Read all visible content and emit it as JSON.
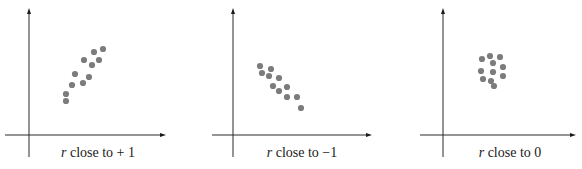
{
  "figure": {
    "panels": [
      {
        "caption_var": "r",
        "caption_text": " close to + 1",
        "caption_x": 98,
        "axes": {
          "origin_x": 29,
          "axis_y": 135,
          "y_top": 8,
          "y_bottom": 157,
          "x_left": 5,
          "x_right": 166
        },
        "points": [
          [
            66,
            101
          ],
          [
            66,
            94
          ],
          [
            72,
            85
          ],
          [
            75,
            74
          ],
          [
            83,
            83
          ],
          [
            89,
            77
          ],
          [
            84,
            60
          ],
          [
            92,
            65
          ],
          [
            94,
            52
          ],
          [
            99,
            60
          ],
          [
            103,
            49
          ]
        ]
      },
      {
        "caption_var": "r",
        "caption_text": " close to −1",
        "caption_x": 302,
        "axes": {
          "origin_x": 233,
          "axis_y": 135,
          "y_top": 8,
          "y_bottom": 157,
          "x_left": 212,
          "x_right": 372
        },
        "points": [
          [
            260,
            66
          ],
          [
            262,
            73
          ],
          [
            271,
            69
          ],
          [
            269,
            76
          ],
          [
            279,
            78
          ],
          [
            273,
            86
          ],
          [
            279,
            91
          ],
          [
            287,
            87
          ],
          [
            287,
            97
          ],
          [
            297,
            97
          ],
          [
            301,
            108
          ]
        ]
      },
      {
        "caption_var": "r",
        "caption_text": " close to 0",
        "caption_x": 510,
        "axes": {
          "origin_x": 443,
          "axis_y": 135,
          "y_top": 8,
          "y_bottom": 157,
          "x_left": 420,
          "x_right": 576
        },
        "points": [
          [
            482,
            59
          ],
          [
            490,
            56
          ],
          [
            500,
            57
          ],
          [
            493,
            63
          ],
          [
            503,
            67
          ],
          [
            481,
            71
          ],
          [
            493,
            72
          ],
          [
            503,
            76
          ],
          [
            483,
            79
          ],
          [
            491,
            81
          ],
          [
            494,
            86
          ]
        ]
      }
    ]
  },
  "chart_data": [
    {
      "type": "scatter",
      "title": "",
      "caption": "r close to + 1",
      "xlabel": "",
      "ylabel": "",
      "grid": false,
      "ticks": false,
      "description": "Strong positive linear association",
      "points": [
        [
          1.0,
          1.0
        ],
        [
          1.0,
          1.9
        ],
        [
          1.6,
          3.0
        ],
        [
          1.9,
          4.4
        ],
        [
          2.7,
          3.3
        ],
        [
          3.3,
          4.1
        ],
        [
          2.8,
          6.2
        ],
        [
          3.6,
          5.6
        ],
        [
          3.8,
          7.2
        ],
        [
          4.3,
          6.2
        ],
        [
          4.7,
          7.6
        ]
      ]
    },
    {
      "type": "scatter",
      "title": "",
      "caption": "r close to −1",
      "xlabel": "",
      "ylabel": "",
      "grid": false,
      "ticks": false,
      "description": "Strong negative linear association",
      "points": [
        [
          1.0,
          7.0
        ],
        [
          1.2,
          6.1
        ],
        [
          2.1,
          6.6
        ],
        [
          1.9,
          5.7
        ],
        [
          2.9,
          5.5
        ],
        [
          2.3,
          4.5
        ],
        [
          2.9,
          3.9
        ],
        [
          3.7,
          4.4
        ],
        [
          3.7,
          3.1
        ],
        [
          4.7,
          3.1
        ],
        [
          5.1,
          1.8
        ]
      ]
    },
    {
      "type": "scatter",
      "title": "",
      "caption": "r close to 0",
      "xlabel": "",
      "ylabel": "",
      "grid": false,
      "ticks": false,
      "description": "No linear association (round cluster)",
      "points": [
        [
          3.9,
          7.6
        ],
        [
          4.7,
          8.0
        ],
        [
          5.7,
          7.9
        ],
        [
          5.0,
          7.1
        ],
        [
          6.0,
          6.6
        ],
        [
          3.8,
          6.1
        ],
        [
          5.0,
          6.0
        ],
        [
          6.0,
          5.5
        ],
        [
          4.0,
          5.1
        ],
        [
          4.8,
          4.9
        ],
        [
          5.1,
          4.2
        ]
      ]
    }
  ]
}
